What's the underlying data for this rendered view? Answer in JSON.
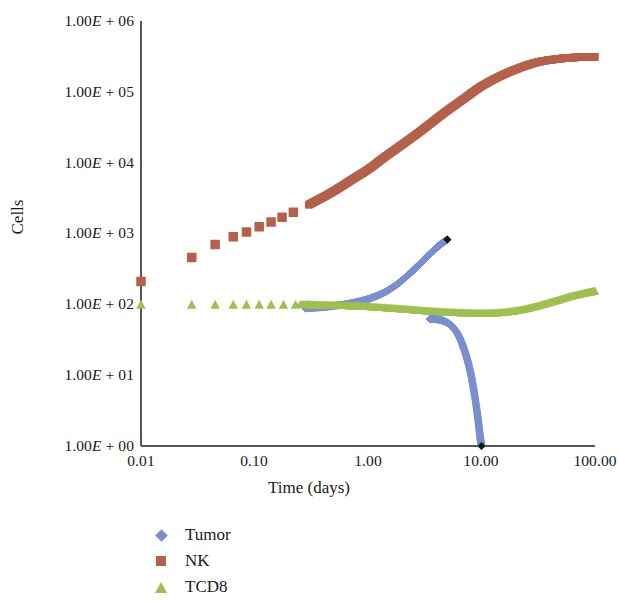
{
  "chart_data": {
    "type": "scatter",
    "title": "",
    "xlabel": "Time (days)",
    "ylabel": "Cells",
    "xscale": "log",
    "yscale": "log",
    "xlim": [
      0.01,
      100
    ],
    "ylim": [
      1,
      1000000
    ],
    "grid": false,
    "legend_position": "bottom-left",
    "xticks": [
      "0.01",
      "0.10",
      "1.00",
      "10.00",
      "100.00"
    ],
    "xtick_values": [
      0.01,
      0.1,
      1,
      10,
      100
    ],
    "yticks": [
      "1.00E + 00",
      "1.00E + 01",
      "1.00E + 02",
      "1.00E + 03",
      "1.00E + 04",
      "1.00E + 05",
      "1.00E + 06"
    ],
    "ytick_values": [
      1,
      10,
      100,
      1000,
      10000,
      100000,
      1000000
    ],
    "series": [
      {
        "name": "Tumor",
        "color": "#7b8fce",
        "marker": "diamond",
        "x": [
          0.28,
          0.35,
          0.44,
          0.55,
          0.7,
          0.88,
          1.1,
          1.4,
          1.75,
          2.2,
          2.6,
          3.0,
          3.4,
          3.8,
          4.2,
          4.6,
          5.0
        ],
        "y": [
          88,
          90,
          93,
          97,
          103,
          112,
          125,
          148,
          185,
          250,
          320,
          400,
          490,
          580,
          670,
          750,
          820
        ]
      },
      {
        "name": "Tumor (decline branch)",
        "color": "#7b8fce",
        "marker": "diamond",
        "x": [
          3.5,
          3.9,
          4.4,
          5.0,
          5.7,
          6.4,
          7.1,
          7.8,
          8.5,
          9.2,
          9.7,
          10.0
        ],
        "y": [
          62,
          62,
          60,
          55,
          46,
          34,
          22,
          13,
          6.5,
          2.8,
          1.4,
          1.0
        ]
      },
      {
        "name": "NK",
        "color": "#b5614a",
        "marker": "square",
        "x": [
          0.01,
          0.028,
          0.045,
          0.065,
          0.085,
          0.11,
          0.14,
          0.175,
          0.22,
          0.28,
          0.35,
          0.45,
          0.58,
          0.75,
          1.0,
          1.4,
          2.0,
          3.0,
          4.5,
          7.0,
          10.0,
          15.0,
          22.0,
          32.0,
          46.0,
          65.0,
          100.0
        ],
        "y": [
          210,
          460,
          700,
          900,
          1050,
          1250,
          1450,
          1700,
          2000,
          2400,
          2900,
          3600,
          4600,
          6000,
          8000,
          12000,
          18000,
          29000,
          48000,
          80000,
          120000,
          170000,
          220000,
          265000,
          290000,
          305000,
          312000
        ]
      },
      {
        "name": "TCD8",
        "color": "#9fc04e",
        "marker": "triangle",
        "x": [
          0.01,
          0.028,
          0.045,
          0.065,
          0.085,
          0.11,
          0.14,
          0.18,
          0.23,
          0.3,
          0.4,
          0.55,
          0.75,
          1.0,
          1.5,
          2.2,
          3.2,
          4.6,
          6.6,
          9.5,
          14,
          20,
          29,
          42,
          60,
          85,
          100
        ],
        "y": [
          100,
          100,
          100,
          100,
          100,
          100,
          100,
          100,
          100,
          100,
          99,
          98,
          96,
          94,
          90,
          86,
          82,
          79,
          77,
          76,
          77,
          82,
          93,
          110,
          130,
          148,
          155
        ]
      },
      {
        "name": "Endpoint markers",
        "color": "#151515",
        "marker": "diamond",
        "x": [
          5.0,
          10.0
        ],
        "y": [
          820,
          1.0
        ]
      }
    ]
  },
  "axes": {
    "y_title": "Cells",
    "x_title": "Time (days)"
  },
  "legend": {
    "items": [
      {
        "label": "Tumor",
        "marker": "diamond-icon",
        "color": "#7b8fce"
      },
      {
        "label": "NK",
        "marker": "square-icon",
        "color": "#b5614a"
      },
      {
        "label": "TCD8",
        "marker": "triangle-icon",
        "color": "#9fc04e"
      }
    ]
  },
  "colors": {
    "tumor": "#7b8fce",
    "nk": "#b5614a",
    "tcd8": "#9fc04e",
    "axis": "#555555",
    "endpoint": "#151515"
  }
}
